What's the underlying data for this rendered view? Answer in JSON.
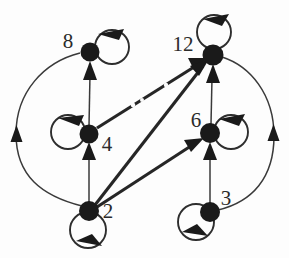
{
  "diagram": {
    "type": "directed-graph",
    "background_color": "#fdfdfd",
    "ink_color": "#1a1a1a",
    "nodes": [
      {
        "id": "n8",
        "label": "8",
        "x": 90,
        "y": 52,
        "r": 9.5,
        "label_x": 68,
        "label_y": 43,
        "loop": "right"
      },
      {
        "id": "n12",
        "label": "12",
        "x": 213,
        "y": 55,
        "r": 10.5,
        "label_x": 183,
        "label_y": 46,
        "loop": "top"
      },
      {
        "id": "n4",
        "label": "4",
        "x": 89,
        "y": 134,
        "r": 9.5,
        "label_x": 107,
        "label_y": 146,
        "loop": "left"
      },
      {
        "id": "n6",
        "label": "6",
        "x": 210,
        "y": 133,
        "r": 10.0,
        "label_x": 196,
        "label_y": 122,
        "loop": "right"
      },
      {
        "id": "n2",
        "label": "2",
        "x": 89,
        "y": 211,
        "r": 10.0,
        "label_x": 108,
        "label_y": 213,
        "loop": "bottom"
      },
      {
        "id": "n3",
        "label": "3",
        "x": 210,
        "y": 212,
        "r": 10.0,
        "label_x": 226,
        "label_y": 200,
        "loop": "bottomleft"
      }
    ],
    "edges": [
      {
        "id": "e_2_4",
        "from": "2",
        "to": "4",
        "style": "straight"
      },
      {
        "id": "e_4_8",
        "from": "4",
        "to": "8",
        "style": "straight"
      },
      {
        "id": "e_3_6",
        "from": "3",
        "to": "6",
        "style": "straight"
      },
      {
        "id": "e_6_12",
        "from": "6",
        "to": "12",
        "style": "straight"
      },
      {
        "id": "e_4_12",
        "from": "4",
        "to": "12",
        "style": "diagonal"
      },
      {
        "id": "e_2_12",
        "from": "2",
        "to": "12",
        "style": "diagonal"
      },
      {
        "id": "e_2_6",
        "from": "2",
        "to": "6",
        "style": "diagonal"
      },
      {
        "id": "e_2_8",
        "from": "2",
        "to": "8",
        "style": "curved-left"
      },
      {
        "id": "e_3_12",
        "from": "3",
        "to": "12",
        "style": "curved-right"
      }
    ],
    "self_loops": [
      {
        "id": "l2",
        "node": "2",
        "position": "bottom"
      },
      {
        "id": "l3",
        "node": "3",
        "position": "bottom-left"
      },
      {
        "id": "l4",
        "node": "4",
        "position": "left"
      },
      {
        "id": "l6",
        "node": "6",
        "position": "right"
      },
      {
        "id": "l8",
        "node": "8",
        "position": "right"
      },
      {
        "id": "l12",
        "node": "12",
        "position": "top"
      }
    ]
  }
}
